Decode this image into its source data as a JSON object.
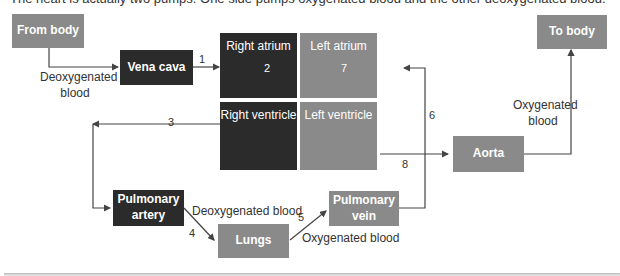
{
  "caption": "The heart is actually two pumps. One side pumps oxygenated blood and the other deoxygenated blood.",
  "nodes": {
    "from_body": "From body",
    "vena_cava": "Vena cava",
    "right_atrium": "Right atrium",
    "left_atrium": "Left atrium",
    "right_ventricle": "Right ventricle",
    "left_ventricle": "Left ventricle",
    "to_body": "To body",
    "aorta": "Aorta",
    "pulmonary_artery": "Pulmonary artery",
    "lungs": "Lungs",
    "pulmonary_vein": "Pulmonary vein"
  },
  "labels": {
    "deoxy_from_body": "Deoxygenated blood",
    "oxy_to_body": "Oxygenated blood",
    "deoxy_to_lungs": "Deoxygenated blood",
    "oxy_from_lungs": "Oxygenated blood"
  },
  "steps": [
    "1",
    "2",
    "3",
    "4",
    "5",
    "6",
    "7",
    "8"
  ],
  "colors": {
    "dark": "#2b2b2b",
    "mid": "#8a8a8a",
    "line": "#444444"
  }
}
